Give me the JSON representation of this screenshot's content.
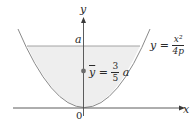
{
  "diagram": {
    "type": "parabola-region-centroid",
    "axes": {
      "x_label": "x",
      "y_label": "y",
      "origin_label": "0"
    },
    "curve": {
      "label_lhs": "y",
      "label_eq": "=",
      "label_num": "x²",
      "label_den": "4p"
    },
    "level_line": {
      "label": "a"
    },
    "centroid": {
      "label_var": "y",
      "label_eq": "=",
      "label_num": "3",
      "label_den": "5",
      "label_suffix": "a"
    },
    "colors": {
      "fill": "#eeeeee",
      "stroke": "#8a8a8a",
      "axis": "#4a4a4a",
      "dot": "#6b6b6b",
      "text": "#2a2a2a"
    }
  }
}
